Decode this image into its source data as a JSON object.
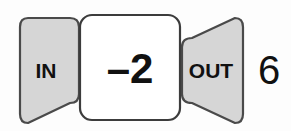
{
  "diagram": {
    "type": "function-machine",
    "input_block": {
      "label": "IN",
      "shape": "right-pointing-trapezoid",
      "fill_color": "#d6d6d6",
      "stroke_color": "#4a4a4a"
    },
    "rule_block": {
      "label": "–2",
      "shape": "rounded-rectangle",
      "fill_color": "#ffffff",
      "stroke_color": "#3c3c3c"
    },
    "output_block": {
      "label": "OUT",
      "shape": "left-pointing-trapezoid",
      "fill_color": "#d6d6d6",
      "stroke_color": "#4a4a4a"
    },
    "result": {
      "value": "6",
      "text_color": "#111111"
    },
    "background_color": "#fdfdfd"
  }
}
